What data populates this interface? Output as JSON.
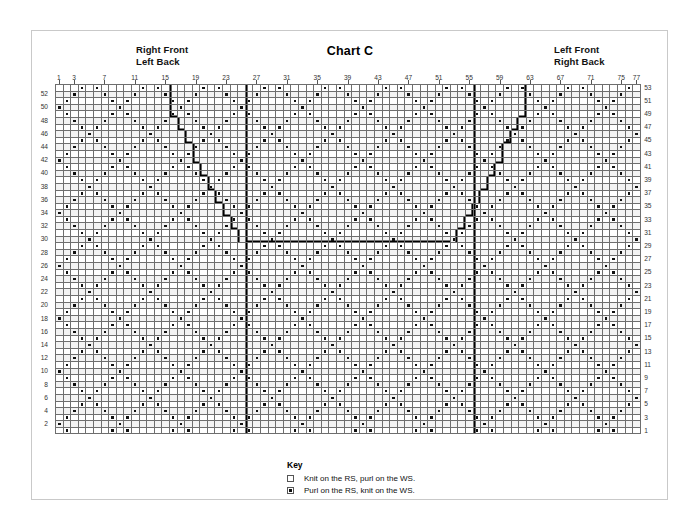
{
  "title": "Chart C",
  "labels": {
    "left_header": "Right Front\nLeft Back",
    "right_header": "Left Front\nRight Back"
  },
  "key": {
    "heading": "Key",
    "items": [
      {
        "symbol": "empty-square",
        "text": "Knit on the RS, purl on the WS."
      },
      {
        "symbol": "dot-square",
        "text": "Purl on the RS, knit on the WS."
      }
    ]
  },
  "chart_data": {
    "type": "table",
    "title": "Chart C",
    "columns": 77,
    "rows": 53,
    "column_ticks": [
      1,
      3,
      7,
      11,
      15,
      19,
      23,
      27,
      31,
      35,
      39,
      43,
      47,
      51,
      55,
      59,
      63,
      67,
      71,
      75,
      77
    ],
    "row_ticks_left": [
      52,
      50,
      48,
      46,
      44,
      42,
      40,
      38,
      36,
      34,
      32,
      30,
      28,
      26,
      24,
      22,
      20,
      18,
      16,
      14,
      12,
      10,
      8,
      6,
      4,
      2
    ],
    "row_ticks_right": [
      53,
      51,
      49,
      47,
      45,
      43,
      41,
      39,
      37,
      35,
      33,
      31,
      29,
      27,
      25,
      23,
      21,
      19,
      17,
      15,
      13,
      11,
      9,
      7,
      5,
      3,
      1
    ],
    "symbols": {
      "blank": "knit on RS, purl on WS",
      "dot": "purl on RS, knit on WS"
    },
    "repeat_markers_after_columns": [
      25,
      55
    ],
    "neckline_bottom_row": 30,
    "neckline_left_top_column": 25,
    "neckline_right_top_column": 53,
    "xlabel": "stitch number",
    "ylabel": "row number",
    "grid": true,
    "legend": [
      "Knit on the RS, purl on the WS.",
      "Purl on the RS, knit on the WS."
    ]
  }
}
